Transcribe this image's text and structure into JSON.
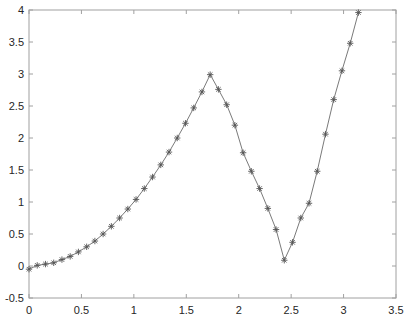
{
  "chart_data": {
    "type": "line",
    "title": "",
    "xlabel": "",
    "ylabel": "",
    "xlim": [
      0,
      3.5
    ],
    "ylim": [
      -0.5,
      4
    ],
    "grid": false,
    "legend": null,
    "box": true,
    "x_ticks": [
      0,
      0.5,
      1,
      1.5,
      2,
      2.5,
      3,
      3.5
    ],
    "x_tick_labels": [
      "0",
      "0.5",
      "1",
      "1.5",
      "2",
      "2.5",
      "3",
      "3.5"
    ],
    "y_ticks": [
      -0.5,
      0,
      0.5,
      1,
      1.5,
      2,
      2.5,
      3,
      3.5,
      4
    ],
    "y_tick_labels": [
      "-0.5",
      "0",
      "0.5",
      "1",
      "1.5",
      "2",
      "2.5",
      "3",
      "3.5",
      "4"
    ],
    "series": [
      {
        "name": "data",
        "line_color": "#7a7a7a",
        "marker": "asterisk",
        "marker_color": "#555555",
        "x": [
          0,
          0.0785,
          0.1571,
          0.2356,
          0.3142,
          0.3927,
          0.4712,
          0.5498,
          0.6283,
          0.7069,
          0.7854,
          0.8639,
          0.9425,
          1.021,
          1.0996,
          1.1781,
          1.2566,
          1.3352,
          1.4137,
          1.4923,
          1.5708,
          1.6493,
          1.7279,
          1.8064,
          1.885,
          1.9635,
          2.042,
          2.1206,
          2.1991,
          2.2777,
          2.3562,
          2.4347,
          2.5133,
          2.5918,
          2.6704,
          2.7489,
          2.8274,
          2.906,
          2.9845,
          3.0631,
          3.1416
        ],
        "values": [
          -0.05,
          0.01,
          0.03,
          0.05,
          0.1,
          0.15,
          0.22,
          0.3,
          0.39,
          0.5,
          0.62,
          0.75,
          0.89,
          1.04,
          1.21,
          1.39,
          1.58,
          1.78,
          2.0,
          2.23,
          2.47,
          2.72,
          2.99,
          2.76,
          2.52,
          2.2,
          1.77,
          1.48,
          1.21,
          0.9,
          0.57,
          0.09,
          0.37,
          0.75,
          0.98,
          1.48,
          2.06,
          2.6,
          3.05,
          3.48,
          3.96
        ]
      }
    ]
  },
  "colors": {
    "background": "#ffffff",
    "axes": "#a0a0a0",
    "tick_text": "#262626"
  }
}
